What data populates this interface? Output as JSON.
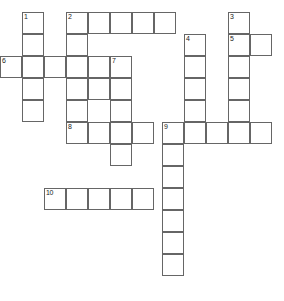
{
  "puzzle": {
    "title": "Crossword Grid",
    "grid": {
      "cell_size": 22,
      "border_color": "#666666",
      "cell_fill": "#ffffff",
      "number_color": "#222222",
      "background": "#ffffff",
      "width": 284,
      "height": 301
    },
    "entries": [
      {
        "number": "1",
        "direction": "down",
        "x": 22,
        "y": 12,
        "length": 5
      },
      {
        "number": "2",
        "direction": "across",
        "x": 66,
        "y": 12,
        "length": 5
      },
      {
        "number": "2",
        "direction": "down",
        "x": 66,
        "y": 12,
        "length": 6
      },
      {
        "number": "3",
        "direction": "down",
        "x": 228,
        "y": 12,
        "length": 5
      },
      {
        "number": "4",
        "direction": "down",
        "x": 184,
        "y": 34,
        "length": 4
      },
      {
        "number": "5",
        "direction": "across",
        "x": 228,
        "y": 34,
        "length": 2
      },
      {
        "number": "6",
        "direction": "across",
        "x": 0,
        "y": 56,
        "length": 7
      },
      {
        "number": "7",
        "direction": "down",
        "x": 110,
        "y": 56,
        "length": 3
      },
      {
        "number": "8",
        "direction": "across",
        "x": 66,
        "y": 122,
        "length": 9
      },
      {
        "number": "9",
        "direction": "down",
        "x": 162,
        "y": 122,
        "length": 8
      },
      {
        "number": "10",
        "direction": "across",
        "x": 44,
        "y": 188,
        "length": 6
      }
    ],
    "cells": [
      {
        "x": 22,
        "y": 12,
        "number": "1",
        "letter": ""
      },
      {
        "x": 22,
        "y": 34,
        "number": "",
        "letter": ""
      },
      {
        "x": 22,
        "y": 56,
        "number": "",
        "letter": ""
      },
      {
        "x": 22,
        "y": 78,
        "number": "",
        "letter": ""
      },
      {
        "x": 22,
        "y": 100,
        "number": "",
        "letter": ""
      },
      {
        "x": 66,
        "y": 12,
        "number": "2",
        "letter": ""
      },
      {
        "x": 88,
        "y": 12,
        "number": "",
        "letter": ""
      },
      {
        "x": 110,
        "y": 12,
        "number": "",
        "letter": ""
      },
      {
        "x": 132,
        "y": 12,
        "number": "",
        "letter": ""
      },
      {
        "x": 154,
        "y": 12,
        "number": "",
        "letter": ""
      },
      {
        "x": 66,
        "y": 34,
        "number": "",
        "letter": ""
      },
      {
        "x": 66,
        "y": 56,
        "number": "",
        "letter": ""
      },
      {
        "x": 66,
        "y": 78,
        "number": "",
        "letter": ""
      },
      {
        "x": 66,
        "y": 100,
        "number": "",
        "letter": ""
      },
      {
        "x": 228,
        "y": 12,
        "number": "3",
        "letter": ""
      },
      {
        "x": 228,
        "y": 34,
        "number": "5",
        "letter": ""
      },
      {
        "x": 250,
        "y": 34,
        "number": "",
        "letter": ""
      },
      {
        "x": 228,
        "y": 56,
        "number": "",
        "letter": ""
      },
      {
        "x": 228,
        "y": 78,
        "number": "",
        "letter": ""
      },
      {
        "x": 228,
        "y": 100,
        "number": "",
        "letter": ""
      },
      {
        "x": 184,
        "y": 34,
        "number": "4",
        "letter": ""
      },
      {
        "x": 184,
        "y": 56,
        "number": "",
        "letter": ""
      },
      {
        "x": 184,
        "y": 78,
        "number": "",
        "letter": ""
      },
      {
        "x": 184,
        "y": 100,
        "number": "",
        "letter": ""
      },
      {
        "x": 0,
        "y": 56,
        "number": "6",
        "letter": ""
      },
      {
        "x": 44,
        "y": 56,
        "number": "",
        "letter": ""
      },
      {
        "x": 88,
        "y": 56,
        "number": "",
        "letter": ""
      },
      {
        "x": 110,
        "y": 56,
        "number": "7",
        "letter": ""
      },
      {
        "x": 110,
        "y": 78,
        "number": "",
        "letter": ""
      },
      {
        "x": 110,
        "y": 100,
        "number": "",
        "letter": ""
      },
      {
        "x": 88,
        "y": 78,
        "number": "",
        "letter": ""
      },
      {
        "x": 66,
        "y": 122,
        "number": "8",
        "letter": ""
      },
      {
        "x": 88,
        "y": 122,
        "number": "",
        "letter": ""
      },
      {
        "x": 110,
        "y": 122,
        "number": "",
        "letter": ""
      },
      {
        "x": 132,
        "y": 122,
        "number": "",
        "letter": ""
      },
      {
        "x": 162,
        "y": 122,
        "number": "9",
        "letter": ""
      },
      {
        "x": 184,
        "y": 122,
        "number": "",
        "letter": ""
      },
      {
        "x": 206,
        "y": 122,
        "number": "",
        "letter": ""
      },
      {
        "x": 228,
        "y": 122,
        "number": "",
        "letter": ""
      },
      {
        "x": 250,
        "y": 122,
        "number": "",
        "letter": ""
      },
      {
        "x": 110,
        "y": 144,
        "number": "",
        "letter": ""
      },
      {
        "x": 162,
        "y": 144,
        "number": "",
        "letter": ""
      },
      {
        "x": 162,
        "y": 166,
        "number": "",
        "letter": ""
      },
      {
        "x": 162,
        "y": 188,
        "number": "",
        "letter": ""
      },
      {
        "x": 162,
        "y": 210,
        "number": "",
        "letter": ""
      },
      {
        "x": 162,
        "y": 232,
        "number": "",
        "letter": ""
      },
      {
        "x": 162,
        "y": 254,
        "number": "",
        "letter": ""
      },
      {
        "x": 44,
        "y": 188,
        "number": "10",
        "letter": ""
      },
      {
        "x": 66,
        "y": 188,
        "number": "",
        "letter": ""
      },
      {
        "x": 88,
        "y": 188,
        "number": "",
        "letter": ""
      },
      {
        "x": 110,
        "y": 188,
        "number": "",
        "letter": ""
      },
      {
        "x": 132,
        "y": 188,
        "number": "",
        "letter": ""
      }
    ]
  }
}
